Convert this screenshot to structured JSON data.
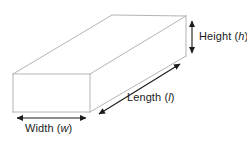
{
  "diagram": {
    "shape": "rectangular-prism",
    "background_color": "#ffffff",
    "edge_color": "#b4b4b4",
    "face_color": "#ffffff",
    "arrow_color": "#1b1b1b",
    "text_color": "#1b1b1b",
    "labels": {
      "height": {
        "name": "Height",
        "open_paren": "(",
        "variable": "h",
        "close_paren": ")"
      },
      "length": {
        "name": "Length",
        "open_paren": "(",
        "variable": "l",
        "close_paren": ")"
      },
      "width": {
        "name": "Width",
        "open_paren": "(",
        "variable": "w",
        "close_paren": ")"
      }
    },
    "geometry": {
      "front_face": {
        "top_left": [
          13,
          74
        ],
        "top_right": [
          90,
          74
        ],
        "bottom_right": [
          90,
          112
        ],
        "bottom_left": [
          13,
          112
        ]
      },
      "back_face": {
        "top_left": [
          112,
          15
        ],
        "top_right": [
          186,
          16
        ],
        "bottom_right": [
          186,
          56
        ],
        "bottom_left": [
          112,
          56
        ]
      },
      "height_arrow": {
        "from": [
          192,
          17
        ],
        "to": [
          192,
          57
        ]
      },
      "length_arrow": {
        "from": [
          96,
          116
        ],
        "to": [
          183,
          62
        ]
      },
      "width_arrow": {
        "from": [
          13,
          118
        ],
        "to": [
          90,
          118
        ]
      }
    }
  }
}
